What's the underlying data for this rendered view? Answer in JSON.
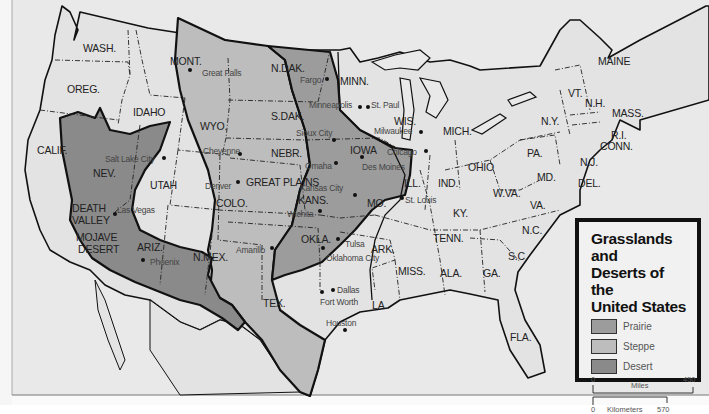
{
  "legend": {
    "title_lines": [
      "Grasslands and",
      "Deserts of the",
      "United States"
    ],
    "items": [
      {
        "label": "Prairie",
        "color": "#9c9c9c"
      },
      {
        "label": "Steppe",
        "color": "#bdbdbd"
      },
      {
        "label": "Desert",
        "color": "#8a8a8a"
      }
    ],
    "scale": {
      "miles_label": "Miles",
      "miles_start": "0",
      "miles_end": "450",
      "km_label": "Kilometers",
      "km_start": "0",
      "km_end": "570"
    }
  },
  "colors": {
    "background": "#e6e6e6",
    "land": "#e2e2e2",
    "prairie": "#9c9c9c",
    "steppe": "#bdbdbd",
    "desert": "#8a8a8a",
    "border": "#111111"
  },
  "states": [
    {
      "label": "WASH.",
      "x": 83,
      "y": 43
    },
    {
      "label": "OREG.",
      "x": 67,
      "y": 84
    },
    {
      "label": "IDAHO",
      "x": 133,
      "y": 107
    },
    {
      "label": "MONT.",
      "x": 170,
      "y": 56
    },
    {
      "label": "WYO.",
      "x": 200,
      "y": 121
    },
    {
      "label": "CALIF.",
      "x": 37,
      "y": 145
    },
    {
      "label": "NEV.",
      "x": 93,
      "y": 168
    },
    {
      "label": "UTAH",
      "x": 150,
      "y": 180
    },
    {
      "label": "COLO.",
      "x": 216,
      "y": 198
    },
    {
      "label": "ARIZ.",
      "x": 137,
      "y": 242
    },
    {
      "label": "N.MEX.",
      "x": 193,
      "y": 252
    },
    {
      "label": "N.DAK.",
      "x": 271,
      "y": 63
    },
    {
      "label": "S.DAK.",
      "x": 271,
      "y": 111
    },
    {
      "label": "NEBR.",
      "x": 271,
      "y": 148
    },
    {
      "label": "KANS.",
      "x": 298,
      "y": 195
    },
    {
      "label": "OKLA.",
      "x": 301,
      "y": 234
    },
    {
      "label": "TEX.",
      "x": 263,
      "y": 298
    },
    {
      "label": "MINN.",
      "x": 340,
      "y": 76
    },
    {
      "label": "IOWA",
      "x": 350,
      "y": 145
    },
    {
      "label": "MO.",
      "x": 367,
      "y": 198
    },
    {
      "label": "ARK.",
      "x": 371,
      "y": 244
    },
    {
      "label": "LA.",
      "x": 372,
      "y": 300
    },
    {
      "label": "WIS.",
      "x": 394,
      "y": 116
    },
    {
      "label": "ILL.",
      "x": 404,
      "y": 178
    },
    {
      "label": "MICH.",
      "x": 443,
      "y": 126
    },
    {
      "label": "IND.",
      "x": 438,
      "y": 178
    },
    {
      "label": "OHIO",
      "x": 468,
      "y": 162
    },
    {
      "label": "KY.",
      "x": 453,
      "y": 208
    },
    {
      "label": "TENN.",
      "x": 433,
      "y": 233
    },
    {
      "label": "MISS.",
      "x": 398,
      "y": 266
    },
    {
      "label": "ALA.",
      "x": 440,
      "y": 268
    },
    {
      "label": "GA.",
      "x": 483,
      "y": 268
    },
    {
      "label": "FLA.",
      "x": 510,
      "y": 332
    },
    {
      "label": "S.C.",
      "x": 508,
      "y": 251
    },
    {
      "label": "N.C.",
      "x": 522,
      "y": 225
    },
    {
      "label": "VA.",
      "x": 530,
      "y": 200
    },
    {
      "label": "W.VA.",
      "x": 493,
      "y": 188
    },
    {
      "label": "PA.",
      "x": 527,
      "y": 148
    },
    {
      "label": "N.Y.",
      "x": 541,
      "y": 116
    },
    {
      "label": "MD.",
      "x": 537,
      "y": 172
    },
    {
      "label": "DEL.",
      "x": 578,
      "y": 178
    },
    {
      "label": "N.J.",
      "x": 580,
      "y": 157
    },
    {
      "label": "VT.",
      "x": 568,
      "y": 88
    },
    {
      "label": "N.H.",
      "x": 585,
      "y": 98
    },
    {
      "label": "MAINE",
      "x": 598,
      "y": 56
    },
    {
      "label": "MASS.",
      "x": 612,
      "y": 108
    },
    {
      "label": "R.I.",
      "x": 611,
      "y": 130
    },
    {
      "label": "CONN.",
      "x": 600,
      "y": 141
    }
  ],
  "regions": [
    {
      "label": "GREAT PLAINS",
      "x": 246,
      "y": 177
    },
    {
      "label": "DEATH",
      "x": 72,
      "y": 203
    },
    {
      "label": "VALLEY",
      "x": 72,
      "y": 215
    },
    {
      "label": "MOJAVE",
      "x": 76,
      "y": 232
    },
    {
      "label": "DESERT",
      "x": 78,
      "y": 244
    }
  ],
  "cities": [
    {
      "label": "Great Falls",
      "x": 202,
      "y": 68,
      "dx": 190,
      "dy": 70
    },
    {
      "label": "Cheyenne",
      "x": 203,
      "y": 146,
      "dx": 240,
      "dy": 154
    },
    {
      "label": "Salt Lake City",
      "x": 105,
      "y": 154,
      "dx": 164,
      "dy": 158
    },
    {
      "label": "Denver",
      "x": 205,
      "y": 181,
      "dx": 238,
      "dy": 182
    },
    {
      "label": "Las Vegas",
      "x": 117,
      "y": 205,
      "dx": 115,
      "dy": 214
    },
    {
      "label": "Phoenix",
      "x": 150,
      "y": 257,
      "dx": 143,
      "dy": 260
    },
    {
      "label": "Amarillo",
      "x": 236,
      "y": 245,
      "dx": 272,
      "dy": 248
    },
    {
      "label": "Fargo",
      "x": 300,
      "y": 75,
      "dx": 327,
      "dy": 79
    },
    {
      "label": "Minneapolis",
      "x": 309,
      "y": 100,
      "dx": 360,
      "dy": 107
    },
    {
      "label": "St. Paul",
      "x": 371,
      "y": 100,
      "dx": 368,
      "dy": 107
    },
    {
      "label": "Sioux City",
      "x": 296,
      "y": 128,
      "dx": 334,
      "dy": 140
    },
    {
      "label": "Milwaukee",
      "x": 374,
      "y": 126,
      "dx": 421,
      "dy": 132
    },
    {
      "label": "Chicago",
      "x": 387,
      "y": 147,
      "dx": 426,
      "dy": 151
    },
    {
      "label": "Omaha",
      "x": 305,
      "y": 161,
      "dx": 336,
      "dy": 163
    },
    {
      "label": "Des Moines",
      "x": 362,
      "y": 162,
      "dx": 362,
      "dy": 157
    },
    {
      "label": "Kansas City",
      "x": 300,
      "y": 183,
      "dx": 355,
      "dy": 195
    },
    {
      "label": "St. Louis",
      "x": 405,
      "y": 195,
      "dx": 402,
      "dy": 198
    },
    {
      "label": "Wichita",
      "x": 287,
      "y": 209,
      "dx": 320,
      "dy": 211
    },
    {
      "label": "Tulsa",
      "x": 345,
      "y": 239,
      "dx": 338,
      "dy": 239
    },
    {
      "label": "Oklahoma City",
      "x": 326,
      "y": 253,
      "dx": 323,
      "dy": 248
    },
    {
      "label": "Dallas",
      "x": 337,
      "y": 285,
      "dx": 333,
      "dy": 290
    },
    {
      "label": "Fort Worth",
      "x": 320,
      "y": 297,
      "dx": 322,
      "dy": 292
    },
    {
      "label": "Houston",
      "x": 326,
      "y": 318,
      "dx": 345,
      "dy": 330
    }
  ]
}
